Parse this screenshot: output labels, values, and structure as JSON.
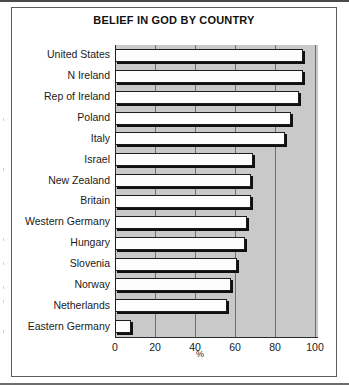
{
  "chart_data": {
    "type": "bar",
    "orientation": "horizontal",
    "title": "BELIEF IN GOD BY COUNTRY",
    "xlabel": "%",
    "ylabel": "",
    "xlim": [
      0,
      100
    ],
    "xticks": [
      0,
      20,
      40,
      60,
      80,
      100
    ],
    "grid": true,
    "legend": false,
    "categories": [
      "United States",
      "N Ireland",
      "Rep of Ireland",
      "Poland",
      "Italy",
      "Israel",
      "New Zealand",
      "Britain",
      "Western Germany",
      "Hungary",
      "Slovenia",
      "Norway",
      "Netherlands",
      "Eastern Germany"
    ],
    "values": [
      94,
      94,
      92,
      88,
      85,
      69,
      68,
      68,
      66,
      65,
      61,
      58,
      56,
      8
    ]
  },
  "axis": {
    "tick_labels": [
      "0",
      "20",
      "40",
      "60",
      "80",
      "100"
    ],
    "unit_label": "%"
  },
  "colors": {
    "bar_fill": "#fdfdfd",
    "bar_outline": "#1c1c1c",
    "bar_shadow": "#101010",
    "plot_background": "#c9c9c9",
    "gridline": "#6f6f6f",
    "text": "#1a1a1a",
    "frame": "#5d5d5d"
  }
}
